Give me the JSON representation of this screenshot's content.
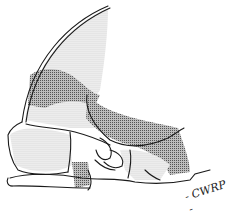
{
  "figure": {
    "kind": "anatomical line drawing (skull/bone section) with stippled and cross-hatched shaded regions",
    "colors": {
      "line": "#1a1a1a",
      "stipple": "#cfcfcf",
      "hatch": "#8a8a8a",
      "background": "#ffffff"
    },
    "signature": "- CWRP -"
  }
}
